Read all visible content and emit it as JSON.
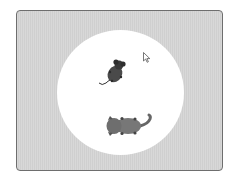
{
  "stage": {
    "background_color": "#d4d4d4",
    "arena_color": "#ffffff",
    "border_color": "#6e6e6e"
  },
  "sprites": [
    {
      "name": "mouse",
      "color": "#3c3c3c",
      "x": 112,
      "y": 64
    },
    {
      "name": "cat",
      "color": "#6a6a6a",
      "x": 133,
      "y": 121
    }
  ],
  "cursor": {
    "type": "arrow-pointer",
    "x": 127,
    "y": 42
  }
}
